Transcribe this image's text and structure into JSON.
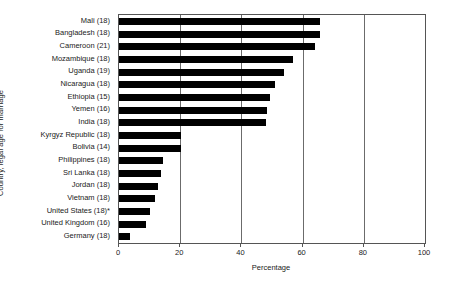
{
  "chart_data": {
    "type": "bar",
    "orientation": "horizontal",
    "title": "",
    "xlabel": "Percentage",
    "ylabel": "Country, legal age for marriage",
    "xlim": [
      0,
      100
    ],
    "xticks": [
      0,
      20,
      40,
      60,
      80,
      100
    ],
    "grid": true,
    "legend": null,
    "bar_color": "#000000",
    "categories": [
      "Mali (18)",
      "Bangladesh (18)",
      "Cameroon (21)",
      "Mozambique (18)",
      "Uganda (19)",
      "Nicaragua (18)",
      "Ethiopia (15)",
      "Yemen (16)",
      "India (18)",
      "Kyrgyz Republic (18)",
      "Bolivia (14)",
      "Philippines (18)",
      "Sri Lanka (18)",
      "Jordan (18)",
      "Vietnam (18)",
      "United States (18)*",
      "United Kingdom (16)",
      "Germany (18)"
    ],
    "values": [
      65.7,
      65.7,
      64.0,
      57.0,
      54.0,
      51.0,
      49.5,
      48.5,
      48.0,
      20.3,
      20.3,
      14.3,
      13.7,
      12.7,
      11.7,
      10.0,
      8.7,
      3.7
    ]
  }
}
